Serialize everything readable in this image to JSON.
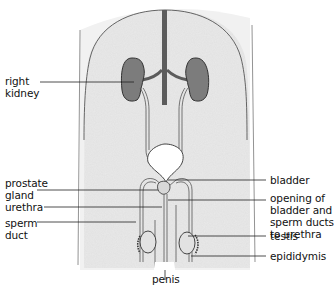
{
  "diagram": {
    "labels_left": {
      "right_kidney": [
        "right",
        "kidney"
      ],
      "prostate_gland": [
        "prostate",
        "gland"
      ],
      "urethra": [
        "urethra"
      ],
      "sperm_duct": [
        "sperm",
        "duct"
      ]
    },
    "labels_right": {
      "bladder": [
        "bladder"
      ],
      "opening": [
        "opening of",
        "bladder and",
        "sperm ducts",
        "to urethra"
      ],
      "testis": [
        "testis"
      ],
      "epididymis": [
        "epididymis"
      ]
    },
    "labels_bottom": {
      "penis": [
        "penis"
      ]
    },
    "colors": {
      "body_fill": "#ececec",
      "outline": "#555555",
      "kidney_fill": "#7a7a7a",
      "vessel": "#555555",
      "bladder_fill": "#ffffff",
      "leader_line": "#222222",
      "text": "#111111"
    }
  }
}
